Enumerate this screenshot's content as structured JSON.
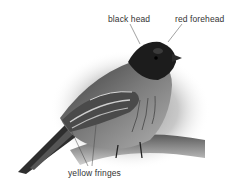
{
  "figure": {
    "labels": [
      {
        "text": "black head"
      },
      {
        "text": "red forehead"
      },
      {
        "text": "yellow fringes"
      }
    ]
  }
}
